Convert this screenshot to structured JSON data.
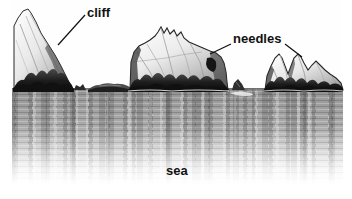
{
  "figure": {
    "style": "grayscale pen-and-ink illustration",
    "background_color": "#ffffff",
    "sea_color": "#a3a3a3",
    "rock_light_color": "#efefef",
    "rock_shadow_color": "#1b1b1b",
    "label_color": "#111111"
  },
  "labels": [
    {
      "id": "cliff",
      "text": "cliff",
      "x": 87,
      "y": 6,
      "leader_from": [
        85,
        15
      ],
      "leader_to": [
        58,
        45
      ]
    },
    {
      "id": "needles",
      "text": "needles",
      "x": 233,
      "y": 32,
      "leader_from": [
        231,
        43
      ],
      "leader_to": [
        211,
        53
      ],
      "leader2_from": [
        284,
        43
      ],
      "leader2_to": [
        301,
        56
      ]
    },
    {
      "id": "sea",
      "text": "sea",
      "x": 166,
      "y": 164,
      "leader_from": null,
      "leader_to": null
    }
  ],
  "features": {
    "cliff_label": "cliff",
    "needles_label": "needles",
    "sea_label": "sea",
    "horizon_y": 89,
    "stack_count": 3
  }
}
